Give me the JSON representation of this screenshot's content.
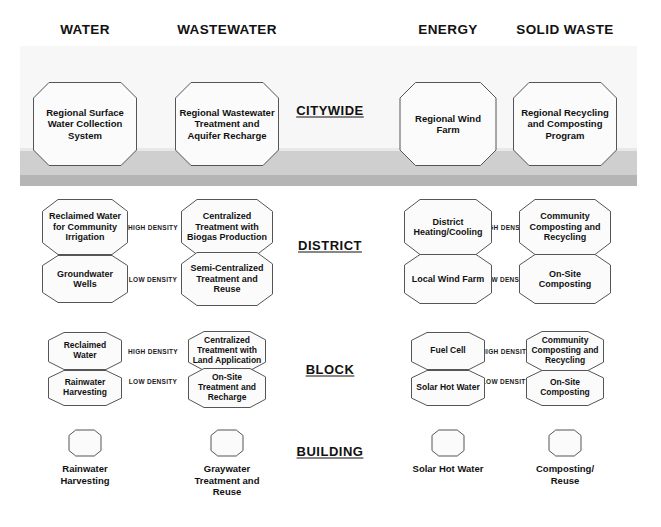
{
  "columns": [
    {
      "label": "WATER",
      "cx": 85
    },
    {
      "label": "WASTEWATER",
      "cx": 227
    },
    {
      "label": "ENERGY",
      "cx": 448
    },
    {
      "label": "SOLID WASTE",
      "cx": 565
    }
  ],
  "levels": [
    {
      "label": "CITYWIDE",
      "cx": 330,
      "cy": 110
    },
    {
      "label": "DISTRICT",
      "cx": 330,
      "cy": 245
    },
    {
      "label": "BLOCK",
      "cx": 330,
      "cy": 369
    },
    {
      "label": "BUILDING",
      "cx": 330,
      "cy": 451
    }
  ],
  "density_labels": [
    {
      "text": "HIGH DENSITY",
      "cx": 153,
      "cy": 227
    },
    {
      "text": "LOW DENSITY",
      "cx": 153,
      "cy": 279
    },
    {
      "text": "HIGH DENSITY",
      "cx": 506,
      "cy": 227
    },
    {
      "text": "LOW DENSITY",
      "cx": 506,
      "cy": 279
    },
    {
      "text": "HIGH DENSITY",
      "cx": 153,
      "cy": 351
    },
    {
      "text": "LOW DENSITY",
      "cx": 153,
      "cy": 381
    },
    {
      "text": "HIGH DENSITY",
      "cx": 506,
      "cy": 351
    },
    {
      "text": "LOW DENSITY",
      "cx": 506,
      "cy": 381
    }
  ],
  "nodes": [
    {
      "text": "Regional Surface Water Collection System",
      "cx": 85,
      "cy": 124,
      "w": 104,
      "h": 84,
      "size": 9.5
    },
    {
      "text": "Regional Wastewater Treatment and Aquifer Recharge",
      "cx": 227,
      "cy": 124,
      "w": 104,
      "h": 84,
      "size": 9.5
    },
    {
      "text": "Regional Wind Farm",
      "cx": 448,
      "cy": 124,
      "w": 97,
      "h": 84,
      "size": 9.5
    },
    {
      "text": "Regional Recycling and Composting Program",
      "cx": 565,
      "cy": 124,
      "w": 104,
      "h": 84,
      "size": 9.5
    },
    {
      "text": "Reclaimed Water for Community Irrigation",
      "cx": 85,
      "cy": 227,
      "w": 86,
      "h": 56,
      "size": 9
    },
    {
      "text": "Centralized Treatment with Biogas Production",
      "cx": 227,
      "cy": 227,
      "w": 92,
      "h": 56,
      "size": 9
    },
    {
      "text": "District Heating/Cooling",
      "cx": 448,
      "cy": 227,
      "w": 88,
      "h": 56,
      "size": 9
    },
    {
      "text": "Community Composting and Recycling",
      "cx": 565,
      "cy": 227,
      "w": 92,
      "h": 56,
      "size": 9
    },
    {
      "text": "Groundwater Wells",
      "cx": 85,
      "cy": 279,
      "w": 86,
      "h": 48,
      "size": 9
    },
    {
      "text": "Semi-Centralized Treatment and Reuse",
      "cx": 227,
      "cy": 279,
      "w": 92,
      "h": 54,
      "size": 9
    },
    {
      "text": "Local Wind Farm",
      "cx": 448,
      "cy": 279,
      "w": 88,
      "h": 50,
      "size": 9
    },
    {
      "text": "On-Site Composting",
      "cx": 565,
      "cy": 279,
      "w": 92,
      "h": 50,
      "size": 9
    },
    {
      "text": "Reclaimed Water",
      "cx": 85,
      "cy": 351,
      "w": 74,
      "h": 38,
      "size": 8.5
    },
    {
      "text": "Centralized Treatment with Land Application",
      "cx": 227,
      "cy": 351,
      "w": 78,
      "h": 40,
      "size": 8.5
    },
    {
      "text": "Fuel Cell",
      "cx": 448,
      "cy": 351,
      "w": 74,
      "h": 38,
      "size": 8.5
    },
    {
      "text": "Community Composting and Recycling",
      "cx": 565,
      "cy": 351,
      "w": 78,
      "h": 40,
      "size": 8.5
    },
    {
      "text": "Rainwater Harvesting",
      "cx": 85,
      "cy": 388,
      "w": 74,
      "h": 36,
      "size": 8.5
    },
    {
      "text": "On-Site Treatment and Recharge",
      "cx": 227,
      "cy": 388,
      "w": 78,
      "h": 40,
      "size": 8.5
    },
    {
      "text": "Solar Hot Water",
      "cx": 448,
      "cy": 388,
      "w": 74,
      "h": 36,
      "size": 8.5
    },
    {
      "text": "On-Site Composting",
      "cx": 565,
      "cy": 388,
      "w": 78,
      "h": 36,
      "size": 8.5
    }
  ],
  "building_nodes": [
    {
      "cx": 85,
      "cy": 443,
      "w": 33,
      "h": 27,
      "caption": "Rainwater\nHarvesting",
      "caption_y": 463
    },
    {
      "cx": 227,
      "cy": 443,
      "w": 33,
      "h": 27,
      "caption": "Graywater\nTreatment and\nReuse",
      "caption_y": 463
    },
    {
      "cx": 448,
      "cy": 443,
      "w": 33,
      "h": 27,
      "caption": "Solar Hot Water",
      "caption_y": 463
    },
    {
      "cx": 565,
      "cy": 443,
      "w": 33,
      "h": 27,
      "caption": "Composting/\nReuse",
      "caption_y": 463
    }
  ],
  "bands": [
    {
      "name": "citywide",
      "color": "#b5b5b5"
    },
    {
      "name": "district",
      "color": "#cfcfcf"
    },
    {
      "name": "block",
      "color": "#e8e8e8"
    },
    {
      "name": "building",
      "color": "#f7f7f7"
    }
  ]
}
